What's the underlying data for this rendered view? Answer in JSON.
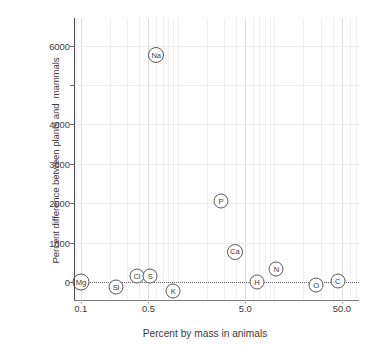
{
  "chart_data": {
    "type": "scatter",
    "title": "",
    "xlabel": "Percent by mass in animals",
    "ylabel": "Percent difference between plants and  mammals",
    "xscale": "log",
    "yscale": "linear",
    "xlim": [
      0.085,
      75
    ],
    "ylim": [
      -450,
      6700
    ],
    "grid": true,
    "legend": false,
    "xticks": [
      {
        "value": 0.1,
        "label": "0.1"
      },
      {
        "value": 0.5,
        "label": "0.5"
      },
      {
        "value": 5.0,
        "label": "5.0"
      },
      {
        "value": 50.0,
        "label": "50.0"
      }
    ],
    "yticks": [
      {
        "value": 0,
        "label": "0"
      },
      {
        "value": 1000,
        "label": "1000"
      },
      {
        "value": 2000,
        "label": "2000"
      },
      {
        "value": 3000,
        "label": "3000"
      },
      {
        "value": 4000,
        "label": "4000"
      },
      {
        "value": 5000,
        "label": ""
      },
      {
        "value": 6000,
        "label": "6000"
      }
    ],
    "points": [
      {
        "label": "Mg",
        "x": 0.1,
        "y": 0
      },
      {
        "label": "Si",
        "x": 0.23,
        "y": -120
      },
      {
        "label": "Cl",
        "x": 0.38,
        "y": 150
      },
      {
        "label": "S",
        "x": 0.52,
        "y": 150
      },
      {
        "label": "Na",
        "x": 0.6,
        "y": 5750
      },
      {
        "label": "K",
        "x": 0.9,
        "y": -220
      },
      {
        "label": "P",
        "x": 2.8,
        "y": 2050
      },
      {
        "label": "Ca",
        "x": 3.9,
        "y": 760
      },
      {
        "label": "H",
        "x": 6.6,
        "y": 0
      },
      {
        "label": "N",
        "x": 10.5,
        "y": 330
      },
      {
        "label": "O",
        "x": 27.0,
        "y": -70
      },
      {
        "label": "C",
        "x": 45.0,
        "y": 30
      }
    ],
    "baseline": {
      "value": 0,
      "style": "dotted"
    },
    "colors": {
      "marker_stroke": "#58585b",
      "marker_fill": "#ffffff",
      "text": "#3b3a3c",
      "grid": "#e9e9ec",
      "axis": "#4a4a4c"
    }
  }
}
